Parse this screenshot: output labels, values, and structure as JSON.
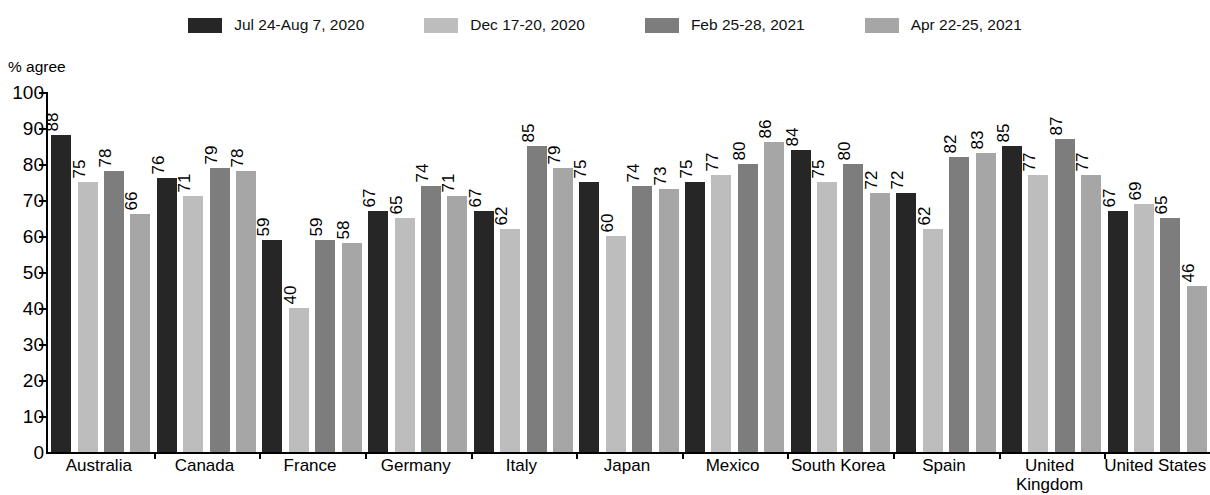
{
  "legend": {
    "items": [
      {
        "label": "Jul 24-Aug 7, 2020",
        "color": "#262626",
        "swatch_name": "legend-swatch-series-1"
      },
      {
        "label": "Dec 17-20, 2020",
        "color": "#bdbdbd",
        "swatch_name": "legend-swatch-series-2"
      },
      {
        "label": "Feb 25-28, 2021",
        "color": "#7d7d7d",
        "swatch_name": "legend-swatch-series-3"
      },
      {
        "label": "Apr 22-25, 2021",
        "color": "#a6a6a6",
        "swatch_name": "legend-swatch-series-4"
      }
    ]
  },
  "axis": {
    "y_label": "% agree",
    "y_ticks": [
      "100",
      "90",
      "80",
      "70",
      "60",
      "50",
      "40",
      "30",
      "20",
      "10",
      "0"
    ]
  },
  "chart_data": {
    "type": "bar",
    "title": "",
    "subtitle": "",
    "xlabel": "",
    "ylabel": "% agree",
    "ylim": [
      0,
      100
    ],
    "ytick_interval": 10,
    "grid": false,
    "legend_position": "top-center",
    "value_labels": true,
    "value_label_rotation": -90,
    "categories": [
      "Australia",
      "Canada",
      "France",
      "Germany",
      "Italy",
      "Japan",
      "Mexico",
      "South Korea",
      "Spain",
      "United Kingdom",
      "United States"
    ],
    "category_display": [
      [
        "Australia"
      ],
      [
        "Canada"
      ],
      [
        "France"
      ],
      [
        "Germany"
      ],
      [
        "Italy"
      ],
      [
        "Japan"
      ],
      [
        "Mexico"
      ],
      [
        "South Korea"
      ],
      [
        "Spain"
      ],
      [
        "United",
        "Kingdom"
      ],
      [
        "United States"
      ]
    ],
    "series": [
      {
        "name": "Jul 24-Aug 7, 2020",
        "color": "#262626",
        "values": [
          88,
          76,
          59,
          67,
          67,
          75,
          75,
          84,
          72,
          85,
          67
        ]
      },
      {
        "name": "Dec 17-20, 2020",
        "color": "#bdbdbd",
        "values": [
          75,
          71,
          40,
          65,
          62,
          60,
          77,
          75,
          62,
          77,
          69
        ]
      },
      {
        "name": "Feb 25-28, 2021",
        "color": "#7d7d7d",
        "values": [
          78,
          79,
          59,
          74,
          85,
          74,
          80,
          80,
          82,
          87,
          65
        ]
      },
      {
        "name": "Apr 22-25, 2021",
        "color": "#a6a6a6",
        "values": [
          66,
          78,
          58,
          71,
          79,
          73,
          86,
          72,
          83,
          77,
          46
        ]
      }
    ]
  }
}
